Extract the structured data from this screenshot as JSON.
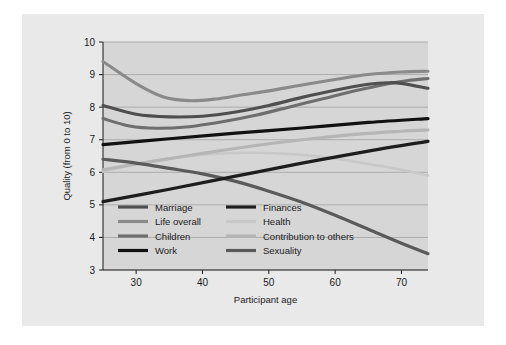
{
  "chart_data": {
    "type": "line",
    "title": "",
    "xlabel": "Participant age",
    "ylabel": "Quality (from 0 to 10)",
    "xlim": [
      25,
      74
    ],
    "ylim": [
      3,
      10
    ],
    "xticks": [
      30,
      40,
      50,
      60,
      70
    ],
    "yticks": [
      3,
      4,
      5,
      6,
      7,
      8,
      9,
      10
    ],
    "grid": true,
    "legend_position": "inside-lower-left",
    "background_color": "#d6d6d6",
    "series": [
      {
        "name": "Marriage",
        "color": "#4f4f4f",
        "width": 3.1,
        "x": [
          25,
          30,
          35,
          40,
          45,
          50,
          55,
          60,
          65,
          68,
          70,
          74
        ],
        "values": [
          8.05,
          7.78,
          7.7,
          7.72,
          7.85,
          8.05,
          8.3,
          8.52,
          8.7,
          8.75,
          8.73,
          8.58
        ]
      },
      {
        "name": "Life overall",
        "color": "#8a8a8a",
        "width": 3.1,
        "x": [
          25,
          30,
          34,
          38,
          42,
          46,
          50,
          55,
          60,
          65,
          70,
          74
        ],
        "values": [
          9.4,
          8.72,
          8.32,
          8.2,
          8.25,
          8.38,
          8.5,
          8.68,
          8.85,
          9.0,
          9.08,
          9.1
        ]
      },
      {
        "name": "Children",
        "color": "#6e6e6e",
        "width": 3.1,
        "x": [
          25,
          29,
          33,
          38,
          43,
          48,
          53,
          58,
          63,
          68,
          71,
          74
        ],
        "values": [
          7.65,
          7.42,
          7.35,
          7.4,
          7.55,
          7.75,
          8.0,
          8.25,
          8.5,
          8.72,
          8.82,
          8.88
        ]
      },
      {
        "name": "Work",
        "color": "#111111",
        "width": 3.2,
        "x": [
          25,
          35,
          45,
          55,
          65,
          74
        ],
        "values": [
          6.85,
          7.03,
          7.2,
          7.36,
          7.53,
          7.65
        ]
      },
      {
        "name": "Finances",
        "color": "#1d1d1d",
        "width": 3.2,
        "x": [
          25,
          35,
          45,
          55,
          65,
          74
        ],
        "values": [
          5.1,
          5.48,
          5.88,
          6.28,
          6.65,
          6.95
        ]
      },
      {
        "name": "Health",
        "color": "#c8c8c8",
        "width": 2.6,
        "x": [
          25,
          30,
          36,
          42,
          48,
          54,
          60,
          66,
          70,
          74
        ],
        "values": [
          6.02,
          6.25,
          6.45,
          6.57,
          6.6,
          6.55,
          6.42,
          6.22,
          6.08,
          5.9
        ]
      },
      {
        "name": "Contribution to others",
        "color": "#b5b5b5",
        "width": 3.1,
        "x": [
          25,
          32,
          40,
          48,
          56,
          64,
          70,
          74
        ],
        "values": [
          6.08,
          6.32,
          6.58,
          6.82,
          7.02,
          7.18,
          7.26,
          7.3
        ]
      },
      {
        "name": "Sexuality",
        "color": "#5a5a5a",
        "width": 3.2,
        "x": [
          25,
          30,
          35,
          40,
          45,
          50,
          55,
          60,
          65,
          70,
          74
        ],
        "values": [
          6.4,
          6.28,
          6.12,
          5.95,
          5.72,
          5.42,
          5.08,
          4.68,
          4.25,
          3.82,
          3.5
        ]
      }
    ]
  },
  "axes": {
    "ylabel": "Quality (from 0 to 10)",
    "xlabel": "Participant age",
    "yticks": [
      "10",
      "9",
      "8",
      "7",
      "6",
      "5",
      "4",
      "3"
    ],
    "xticks": [
      "30",
      "40",
      "50",
      "60",
      "70"
    ]
  },
  "legend": {
    "entries": [
      {
        "label": "Marriage",
        "color": "#4f4f4f"
      },
      {
        "label": "Finances",
        "color": "#1d1d1d"
      },
      {
        "label": "Life overall",
        "color": "#8a8a8a"
      },
      {
        "label": "Health",
        "color": "#c8c8c8"
      },
      {
        "label": "Children",
        "color": "#6e6e6e"
      },
      {
        "label": "Contribution to others",
        "color": "#b5b5b5"
      },
      {
        "label": "Work",
        "color": "#111111"
      },
      {
        "label": "Sexuality",
        "color": "#5a5a5a"
      }
    ]
  }
}
